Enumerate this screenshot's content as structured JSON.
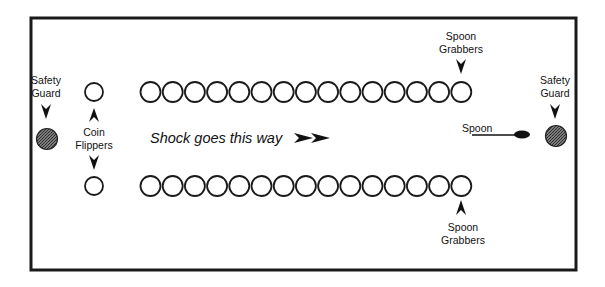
{
  "frame": {
    "border_color": "#1a1a1a",
    "background": "#ffffff"
  },
  "colors": {
    "circle_stroke": "#1a1a1a",
    "guard_fill": "#5c5c5c",
    "spoon_fill": "#111111"
  },
  "coin_rows": {
    "count_per_row": 15,
    "top_label": "",
    "bottom_label": ""
  },
  "labels": {
    "safety_guard_left": [
      "Safety",
      "Guard"
    ],
    "safety_guard_right": [
      "Safety",
      "Guard"
    ],
    "coin_flippers": [
      "Coin",
      "Flippers"
    ],
    "spoon_grabbers_top": [
      "Spoon",
      "Grabbers"
    ],
    "spoon_grabbers_bottom": [
      "Spoon",
      "Grabbers"
    ],
    "spoon": "Spoon",
    "direction": "Shock goes this way",
    "direction_arrows": "➤➤"
  }
}
